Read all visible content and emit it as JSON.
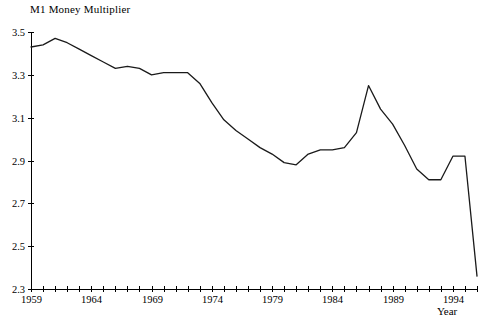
{
  "chart_data": {
    "type": "line",
    "title": "M1 Money Multiplier",
    "xlabel": "Year",
    "ylabel": "",
    "xlim": [
      1959,
      1996
    ],
    "ylim": [
      2.3,
      3.5
    ],
    "yticks": [
      "3.5",
      "3.3",
      "3.1",
      "2.9",
      "2.7",
      "2.5",
      "2.3"
    ],
    "ytick_values": [
      3.5,
      3.3,
      3.1,
      2.9,
      2.7,
      2.5,
      2.3
    ],
    "xticks_labeled": [
      "1959",
      "1964",
      "1969",
      "1974",
      "1979",
      "1984",
      "1989",
      "1994"
    ],
    "xtick_labeled_values": [
      1959,
      1964,
      1969,
      1974,
      1979,
      1984,
      1989,
      1994
    ],
    "xtick_interval_minor": 1,
    "grid": false,
    "legend": "none",
    "series": [
      {
        "name": "M1 Money Multiplier",
        "color": "#1a1a1a",
        "x": [
          1959,
          1960,
          1961,
          1962,
          1963,
          1964,
          1965,
          1966,
          1967,
          1968,
          1969,
          1970,
          1971,
          1972,
          1973,
          1974,
          1975,
          1976,
          1977,
          1978,
          1979,
          1980,
          1981,
          1982,
          1983,
          1984,
          1985,
          1986,
          1987,
          1988,
          1989,
          1990,
          1991,
          1992,
          1993,
          1994,
          1995,
          1996
        ],
        "values": [
          3.43,
          3.44,
          3.47,
          3.45,
          3.42,
          3.39,
          3.36,
          3.33,
          3.34,
          3.33,
          3.3,
          3.31,
          3.31,
          3.31,
          3.26,
          3.17,
          3.09,
          3.04,
          3.0,
          2.96,
          2.93,
          2.89,
          2.88,
          2.93,
          2.95,
          2.95,
          2.96,
          3.03,
          3.25,
          3.14,
          3.07,
          2.97,
          2.86,
          2.81,
          2.81,
          2.92,
          2.92,
          2.36
        ]
      }
    ]
  },
  "axis_geometry": {
    "plot_left": 31,
    "plot_right": 477,
    "plot_top": 32,
    "plot_bottom": 289
  }
}
